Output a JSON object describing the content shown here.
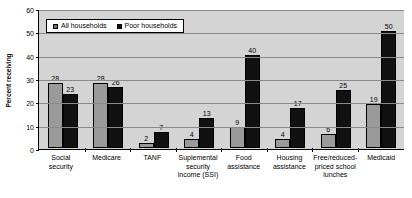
{
  "chart_data": {
    "type": "bar",
    "title": "",
    "subtitle": "",
    "xlabel": "",
    "ylabel": "Percent receiving",
    "ylim": [
      0,
      60
    ],
    "yticks": [
      0,
      10,
      20,
      30,
      40,
      50,
      60
    ],
    "grid": true,
    "legend_position": "top-left",
    "categories": [
      "Social security",
      "Medicare",
      "TANF",
      "Suplemental security income (SSI)",
      "Food assistance",
      "Housing assistance",
      "Free/reduced-priced school lunches",
      "Medicaid"
    ],
    "category_lines": [
      [
        "Social",
        "security"
      ],
      [
        "Medicare"
      ],
      [
        "TANF"
      ],
      [
        "Suplemental",
        "security",
        "income (SSI)"
      ],
      [
        "Food",
        "assistance"
      ],
      [
        "Housing",
        "assistance"
      ],
      [
        "Free/reduced-",
        "priced school",
        "lunches"
      ],
      [
        "Medicaid"
      ]
    ],
    "series": [
      {
        "name": "All households",
        "color": "#9a9a9a",
        "values": [
          28,
          28,
          2,
          4,
          9,
          4,
          6,
          19
        ]
      },
      {
        "name": "Poor households",
        "color": "#111111",
        "values": [
          23,
          26,
          7,
          13,
          40,
          17,
          25,
          50
        ]
      }
    ]
  },
  "legend": {
    "items": [
      {
        "label": "All households",
        "swatch": "series-all"
      },
      {
        "label": "Poor households",
        "swatch": "series-poor"
      }
    ]
  },
  "axes": {
    "y_title": "Percent receiving",
    "y_tick_labels": [
      "60",
      "50",
      "40",
      "30",
      "20",
      "10",
      "0"
    ]
  },
  "colors": {
    "plot_background": "#d4d4d4",
    "gridline": "#8a8a8a",
    "axis": "#000000",
    "series_all": "#9a9a9a",
    "series_poor": "#111111",
    "page_background": "#ffffff"
  }
}
